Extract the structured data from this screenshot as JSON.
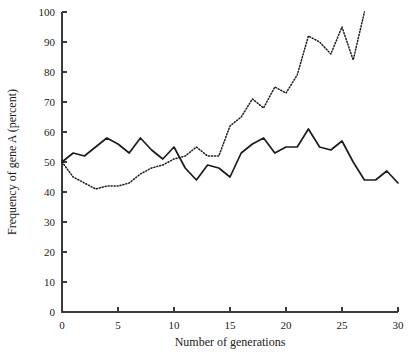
{
  "chart_data": {
    "type": "line",
    "title": "",
    "xlabel": "Number of generations",
    "ylabel": "Frequency of gene A (percent)",
    "xlim": [
      0,
      30
    ],
    "ylim": [
      0,
      100
    ],
    "xticks": [
      0,
      5,
      10,
      15,
      20,
      25,
      30
    ],
    "xtick_labels": [
      "0",
      "5",
      "10",
      "15",
      "20",
      "25",
      "30"
    ],
    "yticks": [
      0,
      10,
      20,
      30,
      40,
      50,
      60,
      70,
      80,
      90,
      100
    ],
    "ytick_labels": [
      "0",
      "10",
      "20",
      "30",
      "40",
      "50",
      "60",
      "70",
      "80",
      "90",
      "100"
    ],
    "grid": false,
    "legend": "none",
    "series": [
      {
        "name": "population-1-solid",
        "style": "solid",
        "color": "#1c1c1c",
        "x": [
          0,
          1,
          2,
          3,
          4,
          5,
          6,
          7,
          8,
          9,
          10,
          11,
          12,
          13,
          14,
          15,
          16,
          17,
          18,
          19,
          20,
          21,
          22,
          23,
          24,
          25,
          26,
          27,
          28,
          29,
          30
        ],
        "values": [
          50,
          53,
          52,
          55,
          58,
          56,
          53,
          58,
          54,
          51,
          55,
          48,
          44,
          49,
          48,
          45,
          53,
          56,
          58,
          53,
          55,
          55,
          61,
          55,
          54,
          57,
          50,
          44,
          44,
          47,
          43
        ]
      },
      {
        "name": "population-2-dotted",
        "style": "dotted",
        "color": "#1c1c1c",
        "x": [
          0,
          1,
          2,
          3,
          4,
          5,
          6,
          7,
          8,
          9,
          10,
          11,
          12,
          13,
          14,
          15,
          16,
          17,
          18,
          19,
          20,
          21,
          22,
          23,
          24,
          25,
          26,
          27
        ],
        "values": [
          50,
          45,
          43,
          41,
          42,
          42,
          43,
          46,
          48,
          49,
          51,
          52,
          55,
          52,
          52,
          62,
          65,
          71,
          68,
          75,
          73,
          79,
          92,
          90,
          86,
          95,
          84,
          100
        ]
      }
    ]
  },
  "figure": {
    "width": 419,
    "height": 352
  }
}
